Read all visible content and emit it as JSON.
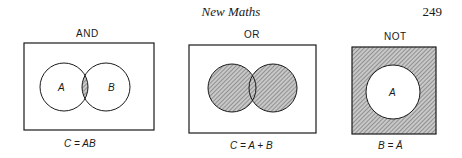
{
  "header": {
    "title": "New Maths",
    "page_number": "249"
  },
  "figures": [
    {
      "label": "AND",
      "circle_labels": [
        "A",
        "B"
      ],
      "caption": "C = AB",
      "shaded": "intersection"
    },
    {
      "label": "OR",
      "circle_labels": [],
      "caption": "C = A + B",
      "shaded": "union"
    },
    {
      "label": "NOT",
      "circle_labels": [
        "A"
      ],
      "caption": "B = Ā",
      "shaded": "complement"
    }
  ],
  "colors": {
    "ink": "#1a1a1a",
    "shade": "#9a9a9a",
    "background": "#ffffff"
  }
}
